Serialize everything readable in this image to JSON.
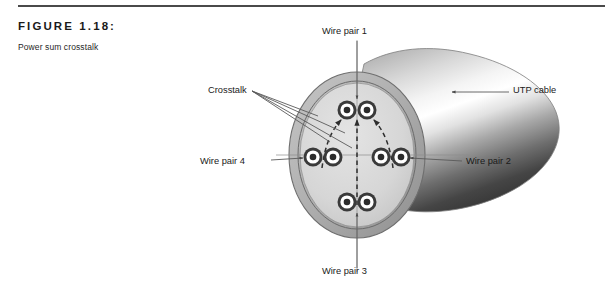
{
  "figure": {
    "number_label": "FIGURE 1.18:",
    "title": "Power sum crosstalk"
  },
  "diagram": {
    "labels": {
      "wire_pair_1": "Wire pair 1",
      "wire_pair_2": "Wire pair 2",
      "wire_pair_3": "Wire pair 3",
      "wire_pair_4": "Wire pair 4",
      "utp_cable": "UTP cable",
      "crosstalk": "Crosstalk"
    },
    "wire_pair_count": 4,
    "conductors_per_pair": 2,
    "colors": {
      "jacket_outer": "#9a9a9a",
      "jacket_inner_fill": "#d8d8d8",
      "cable_body_light": "#f2f2f2",
      "cable_body_dark": "#3c3c3c",
      "conductor_ring": "#333333",
      "line": "#5a5a5a",
      "rule": "#4a4a4a",
      "text": "#1a1a1a"
    }
  }
}
